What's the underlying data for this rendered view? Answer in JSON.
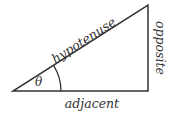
{
  "diagram": {
    "type": "right-triangle",
    "labels": {
      "hypotenuse": "hypotenuse",
      "opposite": "opposite",
      "adjacent": "adjacent",
      "angle": "θ"
    },
    "colors": {
      "stroke": "#333333",
      "text": "#333333",
      "background": "#ffffff"
    }
  }
}
